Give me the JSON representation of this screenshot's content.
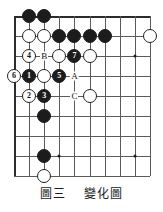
{
  "figure": {
    "caption_label": "圖三",
    "caption_title": "變化圖",
    "type": "go-board-diagram"
  },
  "board": {
    "columns": 10,
    "rows": 9,
    "line_color": "#5a5a5a",
    "edge_color": "#2b2b2b",
    "background": "#ffffff",
    "star_points": [
      {
        "col": 4,
        "row": 8
      },
      {
        "col": 9,
        "row": 8
      },
      {
        "col": 9,
        "row": 3
      }
    ]
  },
  "stones": [
    {
      "id": "b-c2r1",
      "color": "black",
      "label": "",
      "col": 2,
      "row": 1
    },
    {
      "id": "b-c3r1",
      "color": "black",
      "label": "",
      "col": 3,
      "row": 1
    },
    {
      "id": "w-c2r2",
      "color": "white",
      "label": "",
      "col": 2,
      "row": 2
    },
    {
      "id": "w-c3r2",
      "color": "white",
      "label": "",
      "col": 3,
      "row": 2
    },
    {
      "id": "b-c4r2",
      "color": "black",
      "label": "",
      "col": 4,
      "row": 2
    },
    {
      "id": "b-c5r2",
      "color": "black",
      "label": "",
      "col": 5,
      "row": 2
    },
    {
      "id": "b-c6r2",
      "color": "black",
      "label": "",
      "col": 6,
      "row": 2
    },
    {
      "id": "b-c7r2",
      "color": "black",
      "label": "",
      "col": 7,
      "row": 2
    },
    {
      "id": "w-c10r2",
      "color": "white",
      "label": "",
      "col": 10,
      "row": 2
    },
    {
      "id": "w-move-4",
      "color": "white",
      "label": "4",
      "col": 2,
      "row": 3
    },
    {
      "id": "w-c4r3",
      "color": "white",
      "label": "",
      "col": 4,
      "row": 3
    },
    {
      "id": "b-move-7",
      "color": "black",
      "label": "7",
      "col": 5,
      "row": 3
    },
    {
      "id": "w-c6r3",
      "color": "white",
      "label": "",
      "col": 6,
      "row": 3
    },
    {
      "id": "w-move-6",
      "color": "white",
      "label": "6",
      "col": 1,
      "row": 4
    },
    {
      "id": "b-move-1",
      "color": "black",
      "label": "1",
      "col": 2,
      "row": 4
    },
    {
      "id": "w-c3r4",
      "color": "white",
      "label": "",
      "col": 3,
      "row": 4
    },
    {
      "id": "b-move-5",
      "color": "black",
      "label": "5",
      "col": 4,
      "row": 4
    },
    {
      "id": "w-move-2",
      "color": "white",
      "label": "2",
      "col": 2,
      "row": 5
    },
    {
      "id": "b-move-3",
      "color": "black",
      "label": "3",
      "col": 3,
      "row": 5
    },
    {
      "id": "w-c6r5",
      "color": "white",
      "label": "",
      "col": 6,
      "row": 5
    },
    {
      "id": "b-c3r6",
      "color": "black",
      "label": "",
      "col": 3,
      "row": 6
    },
    {
      "id": "b-c3r8",
      "color": "black",
      "label": "",
      "col": 3,
      "row": 8
    },
    {
      "id": "w-c3r9",
      "color": "white",
      "label": "",
      "col": 3,
      "row": 9
    }
  ],
  "point_marks": [
    {
      "id": "mark-B",
      "label": "B",
      "col": 3,
      "row": 3
    },
    {
      "id": "mark-A",
      "label": "A",
      "col": 5,
      "row": 4
    },
    {
      "id": "mark-C",
      "label": "C",
      "col": 5,
      "row": 5
    }
  ]
}
